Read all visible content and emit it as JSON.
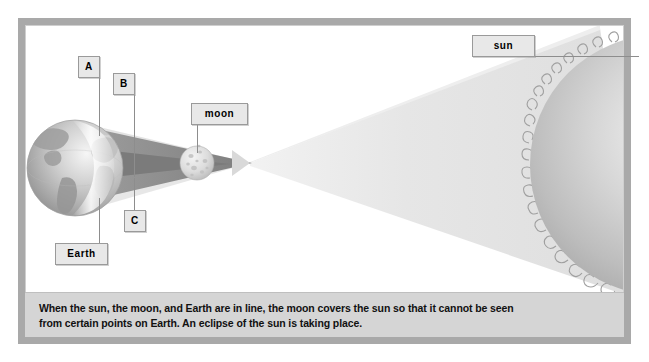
{
  "diagram": {
    "caption": {
      "line1": "When the sun, the moon, and Earth are in line, the moon covers the sun so that it cannot be seen",
      "line2": "from certain points on Earth. An eclipse of the sun is taking place."
    },
    "labels": [
      {
        "id": "a",
        "text": "A"
      },
      {
        "id": "b",
        "text": "B"
      },
      {
        "id": "c",
        "text": "C"
      },
      {
        "id": "earth",
        "text": "Earth"
      },
      {
        "id": "moon",
        "text": "moon"
      },
      {
        "id": "sun",
        "text": "sun"
      }
    ],
    "bodies": [
      {
        "id": "earth",
        "name": "Earth",
        "cx": 75,
        "cy": 168,
        "r": 48
      },
      {
        "id": "moon",
        "name": "moon",
        "cx": 197,
        "cy": 163,
        "r": 17
      },
      {
        "id": "sun",
        "name": "sun",
        "cx": 660,
        "cy": 165,
        "r": 130
      }
    ],
    "colors": {
      "frame": "#a9a9a9",
      "caption_bg": "#d5d5d5",
      "label_bg": "#e8e8e8",
      "label_border": "#9a9a9a",
      "umbra": "#8e8e8e",
      "penumbra": "#dcdcdc",
      "sunbeam": "#e3e3e3",
      "earth_dark": "#a8a8a8",
      "earth_light": "#f0f0f0",
      "moon_body": "#d8d8d8",
      "sun_body": "#c3c3c3"
    }
  }
}
